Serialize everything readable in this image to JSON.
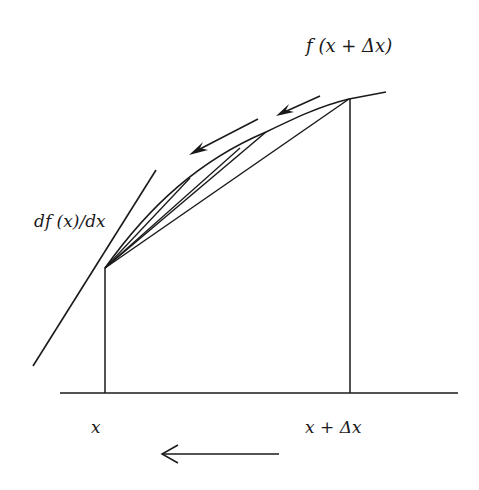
{
  "diagram": {
    "colors": {
      "ink": "#1a1a1a",
      "background": "#ffffff"
    },
    "labels": {
      "f_x_plus_dx": "f (x + Δx)",
      "derivative": "df (x)/dx",
      "x_axis_x": "x",
      "x_axis_x_plus_dx": "x + Δx"
    },
    "geometry": {
      "baseline": {
        "x1": 60,
        "y1": 393,
        "x2": 458,
        "y2": 393
      },
      "point_x": {
        "x": 105,
        "y": 268
      },
      "point_x_plus_dx": {
        "x": 349,
        "y": 99
      },
      "intermediate_point": {
        "x": 266,
        "y": 132
      },
      "tangent_line": {
        "x1": 33,
        "y1": 366,
        "x2": 156,
        "y2": 170
      },
      "vertical_x": {
        "x": 105,
        "y_top": 268,
        "y_bottom": 393
      },
      "vertical_x_plus_dx": {
        "x": 350,
        "y_top": 99,
        "y_bottom": 393
      }
    },
    "arrows": [
      {
        "name": "secant-motion-arrow-upper",
        "direction": "down-left"
      },
      {
        "name": "secant-motion-arrow-lower",
        "direction": "down-left"
      },
      {
        "name": "delta-x-shrink-arrow",
        "direction": "left"
      }
    ]
  }
}
